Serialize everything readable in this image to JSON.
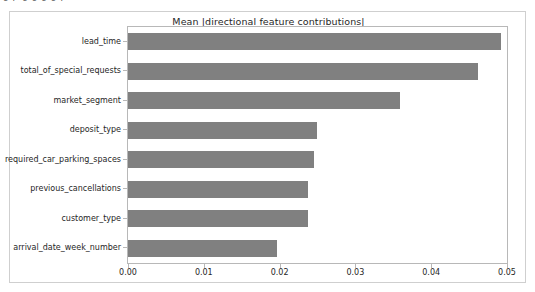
{
  "figure": {
    "background_color": "#ffffff",
    "border_color": "#cfcfcf",
    "top_cut_glyphs": "ig p g g g g p"
  },
  "chart_data": {
    "type": "bar",
    "orientation": "horizontal",
    "title": "Mean |directional feature contributions|",
    "xlabel": "",
    "ylabel": "",
    "categories": [
      "lead_time",
      "total_of_special_requests",
      "market_segment",
      "deposit_type",
      "required_car_parking_spaces",
      "previous_cancellations",
      "customer_type",
      "arrival_date_week_number"
    ],
    "values": [
      0.0492,
      0.0462,
      0.0359,
      0.0249,
      0.0245,
      0.0238,
      0.0237,
      0.0196
    ],
    "xlim": [
      0.0,
      0.05
    ],
    "xticks": [
      0.0,
      0.01,
      0.02,
      0.03,
      0.04,
      0.05
    ],
    "xticklabels": [
      "0.00",
      "0.01",
      "0.02",
      "0.03",
      "0.04",
      "0.05"
    ],
    "bar_color": "#808080",
    "grid": false,
    "legend": null,
    "axes_edge_color": "#b8b8b8"
  }
}
